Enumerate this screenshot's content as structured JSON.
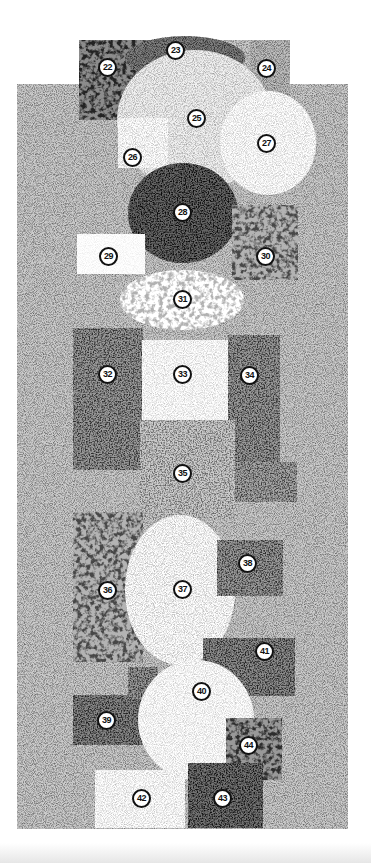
{
  "figure": {
    "background_field": {
      "x": 17,
      "y": 84,
      "w": 331,
      "h": 745,
      "tone": 0.55
    },
    "top_cap": {
      "x": 79,
      "y": 40,
      "w": 211,
      "h": 46,
      "tone": 0.55
    },
    "patches": [
      {
        "id": "22",
        "label": "22",
        "shape": "rect",
        "x": 79,
        "y": 40,
        "w": 90,
        "h": 80,
        "tone": 0.3,
        "grain": "coarse"
      },
      {
        "id": "23",
        "label": "23",
        "shape": "ellipse",
        "cx": 185,
        "cy": 58,
        "rx": 60,
        "ry": 22,
        "tone": 0.25,
        "grain": "fine"
      },
      {
        "id": "24",
        "label": "24",
        "shape": "rect",
        "x": 250,
        "y": 40,
        "w": 40,
        "h": 60,
        "tone": 0.5,
        "grain": "fine"
      },
      {
        "id": "25",
        "label": "25",
        "shape": "ellipse",
        "cx": 195,
        "cy": 120,
        "rx": 78,
        "ry": 70,
        "tone": 0.7,
        "grain": "fine"
      },
      {
        "id": "26",
        "label": "26",
        "shape": "rect",
        "x": 118,
        "y": 118,
        "w": 50,
        "h": 50,
        "tone": 0.78,
        "grain": "fine"
      },
      {
        "id": "27",
        "label": "27",
        "shape": "ellipse",
        "cx": 268,
        "cy": 143,
        "rx": 48,
        "ry": 52,
        "tone": 0.8,
        "grain": "fine"
      },
      {
        "id": "28",
        "label": "28",
        "shape": "ellipse",
        "cx": 183,
        "cy": 213,
        "rx": 55,
        "ry": 50,
        "tone": 0.15,
        "grain": "medium"
      },
      {
        "id": "29",
        "label": "29",
        "shape": "rect",
        "x": 77,
        "y": 234,
        "w": 68,
        "h": 40,
        "tone": 0.97,
        "grain": "fine"
      },
      {
        "id": "30",
        "label": "30",
        "shape": "rect",
        "x": 232,
        "y": 205,
        "w": 66,
        "h": 75,
        "tone": 0.45,
        "grain": "coarse"
      },
      {
        "id": "31",
        "label": "31",
        "shape": "ellipse",
        "cx": 182,
        "cy": 300,
        "rx": 62,
        "ry": 30,
        "tone": 0.75,
        "grain": "coarse"
      },
      {
        "id": "32",
        "label": "32",
        "shape": "rect",
        "x": 73,
        "y": 328,
        "w": 70,
        "h": 142,
        "tone": 0.35,
        "grain": "medium"
      },
      {
        "id": "33",
        "label": "33",
        "shape": "rect",
        "x": 142,
        "y": 340,
        "w": 90,
        "h": 90,
        "tone": 0.82,
        "grain": "fine"
      },
      {
        "id": "34",
        "label": "34",
        "shape": "rect",
        "x": 228,
        "y": 335,
        "w": 52,
        "h": 130,
        "tone": 0.35,
        "grain": "medium"
      },
      {
        "id": "35",
        "label": "35",
        "shape": "rect",
        "x": 140,
        "y": 420,
        "w": 95,
        "h": 100,
        "tone": 0.55,
        "grain": "medium"
      },
      {
        "id": "35b",
        "label": "",
        "shape": "rect",
        "x": 235,
        "y": 462,
        "w": 62,
        "h": 40,
        "tone": 0.4,
        "grain": "medium"
      },
      {
        "id": "36",
        "label": "36",
        "shape": "rect",
        "x": 73,
        "y": 512,
        "w": 70,
        "h": 150,
        "tone": 0.45,
        "grain": "coarse"
      },
      {
        "id": "37",
        "label": "37",
        "shape": "ellipse",
        "cx": 180,
        "cy": 590,
        "rx": 55,
        "ry": 75,
        "tone": 0.75,
        "grain": "fine"
      },
      {
        "id": "38",
        "label": "38",
        "shape": "rect",
        "x": 217,
        "y": 540,
        "w": 66,
        "h": 56,
        "tone": 0.35,
        "grain": "medium"
      },
      {
        "id": "41",
        "label": "41",
        "shape": "rect",
        "x": 203,
        "y": 638,
        "w": 92,
        "h": 58,
        "tone": 0.3,
        "grain": "medium"
      },
      {
        "id": "39",
        "label": "39",
        "shape": "rect",
        "x": 73,
        "y": 695,
        "w": 70,
        "h": 50,
        "tone": 0.28,
        "grain": "medium"
      },
      {
        "id": "39b",
        "label": "",
        "shape": "rect",
        "x": 128,
        "y": 667,
        "w": 30,
        "h": 32,
        "tone": 0.35,
        "grain": "medium"
      },
      {
        "id": "40",
        "label": "40",
        "shape": "ellipse",
        "cx": 196,
        "cy": 720,
        "rx": 58,
        "ry": 60,
        "tone": 0.82,
        "grain": "fine"
      },
      {
        "id": "44",
        "label": "44",
        "shape": "rect",
        "x": 226,
        "y": 718,
        "w": 56,
        "h": 62,
        "tone": 0.35,
        "grain": "coarse"
      },
      {
        "id": "42",
        "label": "42",
        "shape": "rect",
        "x": 95,
        "y": 770,
        "w": 90,
        "h": 58,
        "tone": 0.8,
        "grain": "fine"
      },
      {
        "id": "43",
        "label": "43",
        "shape": "rect",
        "x": 188,
        "y": 763,
        "w": 75,
        "h": 65,
        "tone": 0.2,
        "grain": "medium"
      }
    ],
    "label_positions": [
      {
        "label": "22",
        "x": 108,
        "y": 68
      },
      {
        "label": "23",
        "x": 176,
        "y": 51
      },
      {
        "label": "24",
        "x": 267,
        "y": 69
      },
      {
        "label": "25",
        "x": 197,
        "y": 119
      },
      {
        "label": "26",
        "x": 133,
        "y": 158
      },
      {
        "label": "27",
        "x": 267,
        "y": 144
      },
      {
        "label": "28",
        "x": 183,
        "y": 213
      },
      {
        "label": "29",
        "x": 109,
        "y": 257
      },
      {
        "label": "30",
        "x": 266,
        "y": 257
      },
      {
        "label": "31",
        "x": 183,
        "y": 300
      },
      {
        "label": "32",
        "x": 108,
        "y": 375
      },
      {
        "label": "33",
        "x": 183,
        "y": 375
      },
      {
        "label": "34",
        "x": 250,
        "y": 376
      },
      {
        "label": "35",
        "x": 183,
        "y": 474
      },
      {
        "label": "36",
        "x": 108,
        "y": 591
      },
      {
        "label": "37",
        "x": 183,
        "y": 590
      },
      {
        "label": "38",
        "x": 248,
        "y": 564
      },
      {
        "label": "39",
        "x": 107,
        "y": 721
      },
      {
        "label": "40",
        "x": 202,
        "y": 692
      },
      {
        "label": "41",
        "x": 265,
        "y": 652
      },
      {
        "label": "42",
        "x": 142,
        "y": 799
      },
      {
        "label": "43",
        "x": 223,
        "y": 799
      },
      {
        "label": "44",
        "x": 249,
        "y": 746
      }
    ]
  }
}
